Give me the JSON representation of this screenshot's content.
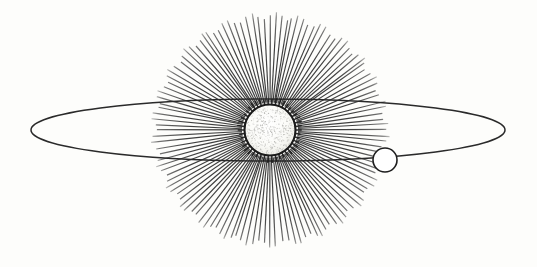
{
  "figure": {
    "title": "Sun with radiating corona and planetary orbit",
    "style": "antique line engraving",
    "background_color": "#fdfdfb",
    "canvas": {
      "width": 537,
      "height": 267
    }
  },
  "sun": {
    "name": "Sun",
    "center_x": 270,
    "center_y": 130,
    "radius": 25.5,
    "outline_color": "#1a1a1a",
    "fill_color": "#fbfbf9",
    "stipple_color": "#9a9a96",
    "stipple_dots": 520,
    "flame_tufts": 46
  },
  "corona": {
    "name": "Radiating rays",
    "ray_count": 124,
    "inner_radius": 28,
    "outer_radius": 118,
    "ray_color": "#2b2b2b",
    "ray_width_inner": 1.5,
    "ray_width_outer": 0.5,
    "center_x": 270,
    "center_y": 130
  },
  "orbit": {
    "name": "Orbital ellipse",
    "center_x": 268,
    "center_y": 130,
    "radius_x": 237,
    "radius_y": 31,
    "stroke_color": "#2a2a2a",
    "stroke_width": 1.5,
    "left_vertex_x": 31,
    "right_vertex_x": 505,
    "top_chord_y": 99,
    "bottom_chord_y": 161
  },
  "planet": {
    "name": "Planet",
    "center_x": 385,
    "center_y": 160,
    "radius": 12,
    "outline_color": "#1e1e1e",
    "fill_color": "#ffffff",
    "stroke_width": 1.6
  },
  "labels": {
    "alt_text": "Engraved diagram of the Sun emitting rays, encircled by an elliptical orbit carrying a small planet"
  }
}
